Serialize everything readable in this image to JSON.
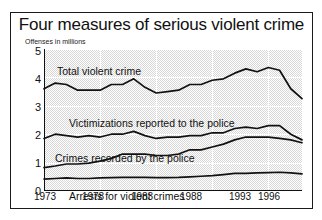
{
  "chart_data": {
    "type": "line",
    "title": "Four measures of serious violent crime",
    "subtitle": "Offenses in millions",
    "xlabel": "",
    "ylabel": "Offenses in millions",
    "grid": true,
    "legend_position": "inline-labels",
    "xlim": [
      1973,
      1996
    ],
    "ylim": [
      0,
      5
    ],
    "yticks": [
      "0",
      "1",
      "2",
      "3",
      "4",
      "5"
    ],
    "xticks": [
      "1973",
      "1978",
      "1983",
      "1988",
      "1993",
      "1996"
    ],
    "x": [
      1973,
      1974,
      1975,
      1976,
      1977,
      1978,
      1979,
      1980,
      1981,
      1982,
      1983,
      1984,
      1985,
      1986,
      1987,
      1988,
      1989,
      1990,
      1991,
      1992,
      1993,
      1994,
      1995,
      1996
    ],
    "series": [
      {
        "name": "Total violent crime",
        "values": [
          3.6,
          3.8,
          3.75,
          3.55,
          3.55,
          3.55,
          3.75,
          3.75,
          3.95,
          3.65,
          3.45,
          3.5,
          3.55,
          3.75,
          3.75,
          3.9,
          3.95,
          4.15,
          4.3,
          4.2,
          4.35,
          4.25,
          3.6,
          3.25
        ]
      },
      {
        "name": "Victimizations reported to the police",
        "values": [
          1.85,
          2.0,
          1.95,
          1.9,
          1.95,
          1.9,
          2.0,
          2.0,
          2.1,
          1.95,
          1.85,
          1.9,
          1.9,
          1.95,
          1.95,
          2.05,
          2.05,
          2.2,
          2.25,
          2.2,
          2.3,
          2.3,
          2.0,
          1.8
        ]
      },
      {
        "name": "Crimes recorded by the police",
        "values": [
          0.82,
          0.88,
          0.95,
          0.95,
          0.98,
          1.05,
          1.15,
          1.3,
          1.3,
          1.3,
          1.25,
          1.25,
          1.3,
          1.45,
          1.45,
          1.55,
          1.65,
          1.8,
          1.9,
          1.9,
          1.9,
          1.85,
          1.8,
          1.7
        ]
      },
      {
        "name": "Arrests for violent crimes",
        "values": [
          0.42,
          0.44,
          0.46,
          0.44,
          0.44,
          0.46,
          0.47,
          0.48,
          0.48,
          0.48,
          0.47,
          0.47,
          0.48,
          0.5,
          0.52,
          0.54,
          0.58,
          0.62,
          0.62,
          0.64,
          0.65,
          0.66,
          0.64,
          0.6
        ]
      }
    ],
    "series_label_positions": [
      {
        "left": 46,
        "top": 52
      },
      {
        "left": 58,
        "top": 104
      },
      {
        "left": 44,
        "top": 139
      },
      {
        "left": 58,
        "top": 177
      }
    ],
    "colors": {
      "line": "#111111",
      "frame": "#1a1a1a",
      "plot_background": "#ededed",
      "grid": "#ffffff",
      "text": "#111111"
    }
  }
}
